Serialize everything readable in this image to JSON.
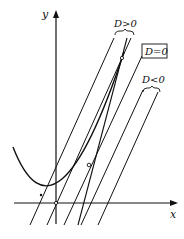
{
  "figure": {
    "axes": {
      "x_label": "x",
      "y_label": "y"
    },
    "labels": {
      "d_positive": "D>0",
      "d_zero": "D=0",
      "d_negative": "D<0"
    },
    "colors": {
      "stroke": "#111111",
      "background": "#ffffff"
    }
  }
}
